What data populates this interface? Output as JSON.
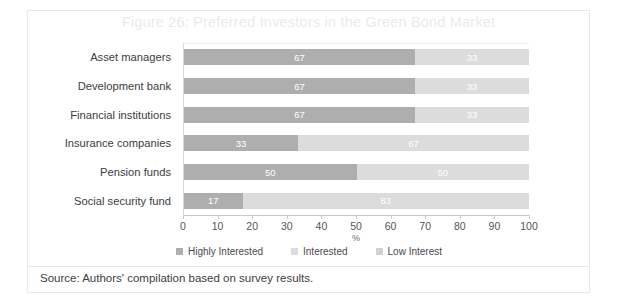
{
  "figure": {
    "title": "Figure 26: Preferred Investors in the Green Bond Market",
    "source": "Source: Authors' compilation based on survey results."
  },
  "colors": {
    "highly_interested": "#aeaeae",
    "interested": "#dcdcdc",
    "low_interest": "#d0d0d0",
    "title": "#eceaee",
    "axis": "#c9c9cc",
    "text": "#3d3d40",
    "frame": "#e9e9ec"
  },
  "chart_data": {
    "type": "bar",
    "orientation": "horizontal",
    "stacked": true,
    "stack_mode": "percent",
    "title": "Figure 26: Preferred Investors in the Green Bond Market",
    "xlabel": "%",
    "ylabel": "",
    "xlim": [
      0,
      100
    ],
    "xticks": [
      0,
      10,
      20,
      30,
      40,
      50,
      60,
      70,
      80,
      90,
      100
    ],
    "grid": false,
    "legend_position": "bottom",
    "categories": [
      "Asset managers",
      "Development bank",
      "Financial institutions",
      "Insurance companies",
      "Pension funds",
      "Social security fund"
    ],
    "series": [
      {
        "name": "Highly Interested",
        "color": "#aeaeae",
        "values": [
          67,
          67,
          67,
          33,
          50,
          17
        ]
      },
      {
        "name": "Interested",
        "color": "#dcdcdc",
        "values": [
          33,
          33,
          33,
          67,
          50,
          83
        ]
      },
      {
        "name": "Low Interest",
        "color": "#d0d0d0",
        "values": [
          0,
          0,
          0,
          0,
          0,
          0
        ]
      }
    ],
    "data_labels": [
      [
        "67",
        "33"
      ],
      [
        "67",
        "33"
      ],
      [
        "67",
        "33"
      ],
      [
        "33",
        "67"
      ],
      [
        "50",
        "50"
      ],
      [
        "17",
        "83"
      ]
    ]
  }
}
